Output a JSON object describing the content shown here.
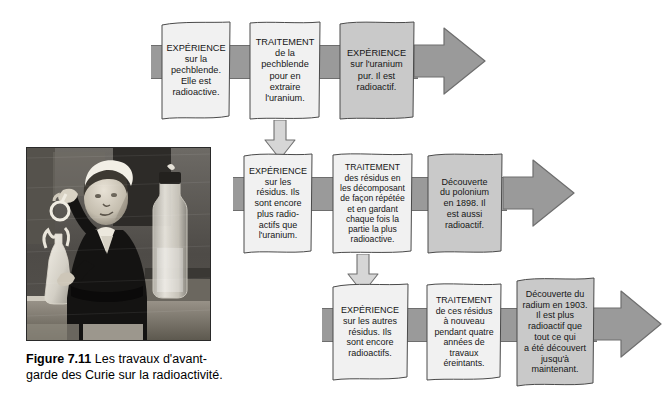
{
  "figure": {
    "number": "Figure 7.11",
    "caption": "Les travaux d'avant-garde des Curie sur la radioactivité.",
    "photo_alt": "marie-curie-laboratory-photo"
  },
  "colors": {
    "arrow": "#9a9a9a",
    "arrow_outline": "#6e6e6e",
    "box_light": "#f1f1f1",
    "box_dark": "#c9c9c9",
    "text": "#161616",
    "page_background": "#ffffff"
  },
  "rows": [
    {
      "id": "row-1",
      "boxes": [
        {
          "id": "r1-b1",
          "shade": "light",
          "title": "EXPÉRIENCE",
          "lines": [
            "sur la",
            "pechblende.",
            "Elle est",
            "radioactive."
          ]
        },
        {
          "id": "r1-b2",
          "shade": "light",
          "title": "TRAITEMENT",
          "lines": [
            "de la",
            "pechblende",
            "pour en",
            "extraire",
            "l'uranium."
          ]
        },
        {
          "id": "r1-b3",
          "shade": "dark",
          "title": "EXPÉRIENCE",
          "lines": [
            "sur l'uranium",
            "pur. Il est",
            "radioactif."
          ]
        }
      ]
    },
    {
      "id": "row-2",
      "boxes": [
        {
          "id": "r2-b1",
          "shade": "light",
          "title": "EXPÉRIENCE",
          "lines": [
            "sur les",
            "résidus. Ils",
            "sont encore",
            "plus radio-",
            "actifs que",
            "l'uranium."
          ]
        },
        {
          "id": "r2-b2",
          "shade": "light",
          "title": "TRAITEMENT",
          "lines": [
            "des résidus en",
            "les décomposant",
            "de façon répétée",
            "et en gardant",
            "chaque fois la",
            "partie la plus",
            "radioactive."
          ]
        },
        {
          "id": "r2-b3",
          "shade": "dark",
          "title": "",
          "lines": [
            "Découverte",
            "du polonium",
            "en 1898. Il",
            "est aussi",
            "radioactif."
          ]
        }
      ]
    },
    {
      "id": "row-3",
      "boxes": [
        {
          "id": "r3-b1",
          "shade": "light",
          "title": "EXPÉRIENCE",
          "lines": [
            "sur les autres",
            "résidus. Ils",
            "sont encore",
            "radioactifs."
          ]
        },
        {
          "id": "r3-b2",
          "shade": "light",
          "title": "TRAITEMENT",
          "lines": [
            "de ces résidus",
            "à nouveau",
            "pendant quatre",
            "années de",
            "travaux",
            "éreintants."
          ]
        },
        {
          "id": "r3-b3",
          "shade": "dark",
          "title": "",
          "lines": [
            "Découverte du",
            "radium en 1903.",
            "Il est plus",
            "radioactif que",
            "tout ce qui",
            "a été découvert",
            "jusqu'à",
            "maintenant."
          ]
        }
      ]
    }
  ],
  "connectors": [
    {
      "id": "down-arrow-1",
      "label": "down-arrow-row1-to-row2"
    },
    {
      "id": "down-arrow-2",
      "label": "down-arrow-row2-to-row3"
    }
  ]
}
